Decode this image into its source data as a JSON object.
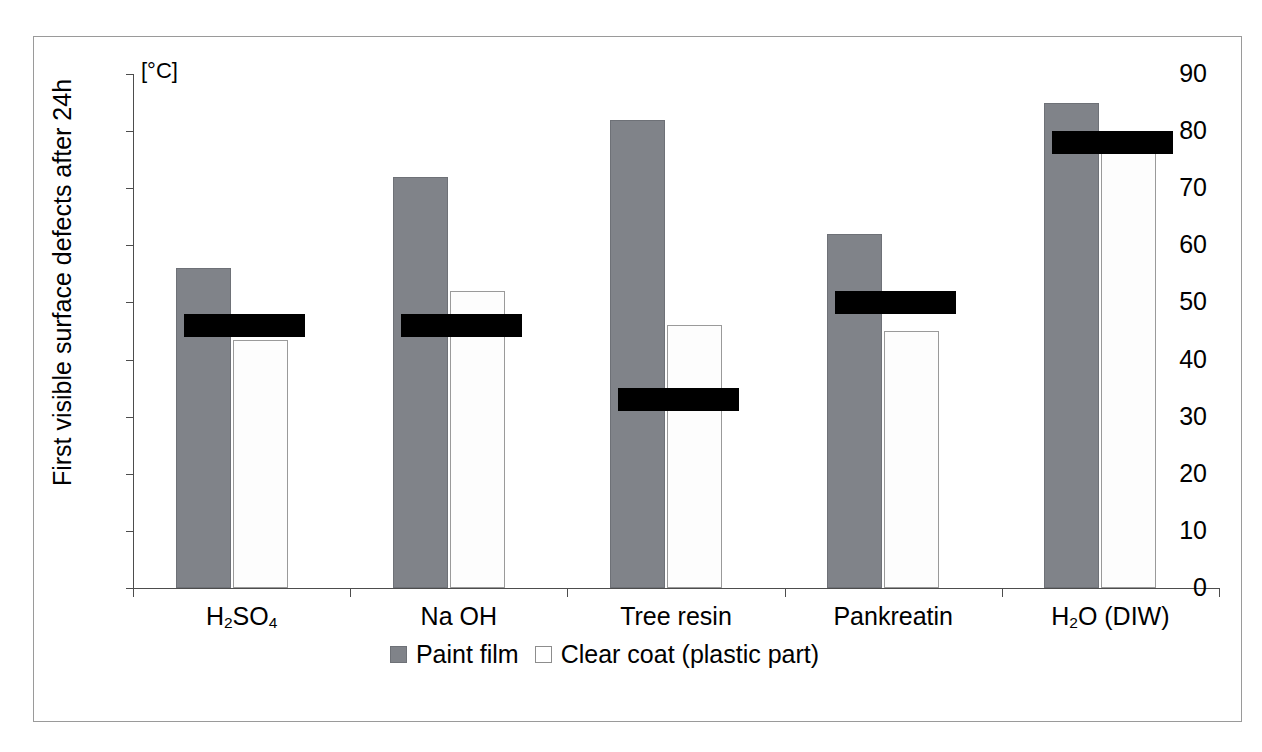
{
  "chart_data": {
    "type": "bar",
    "title": "",
    "ylabel": "First visible surface defects after 24h",
    "yunit": "[°C]",
    "xlabel": "",
    "ylim": [
      0,
      90
    ],
    "ytick_step": 10,
    "yticks": [
      90,
      80,
      70,
      60,
      50,
      40,
      30,
      20,
      10,
      0
    ],
    "grid": false,
    "legend_position": "bottom-center",
    "categories": [
      "H2SO4",
      "Na OH",
      "Tree resin",
      "Pankreatin",
      "H2O (DIW)"
    ],
    "category_labels_html": [
      "H<sub>2</sub>SO<sub>4</sub>",
      "Na OH",
      "Tree resin",
      "Pankreatin",
      "H<sub>2</sub>O (DIW)"
    ],
    "series": [
      {
        "name": "Paint film",
        "color": "#808389",
        "values": [
          56,
          72,
          82,
          62,
          85
        ]
      },
      {
        "name": "Clear coat (plastic part)",
        "color": "#ffffff",
        "values": [
          43.5,
          52,
          46,
          45,
          80
        ]
      }
    ],
    "overlay_bands": {
      "name": "black marker band",
      "color": "#000000",
      "ranges": [
        [
          44,
          48
        ],
        [
          44,
          48
        ],
        [
          31,
          35
        ],
        [
          48,
          52
        ],
        [
          76,
          80
        ]
      ]
    }
  },
  "legend": {
    "items": [
      {
        "label": "Paint film",
        "swatch": "filled-gray-square"
      },
      {
        "label": "Clear coat (plastic part)",
        "swatch": "empty-white-square"
      }
    ]
  }
}
